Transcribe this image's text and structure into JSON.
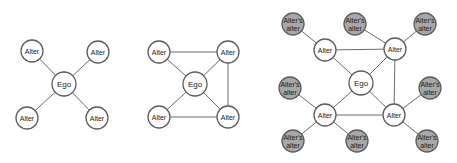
{
  "labels": {
    "ego": "Ego",
    "alter": "Alter",
    "alters_alter_line1": "Alter's",
    "alters_alter_line2": "alter"
  },
  "colors": {
    "node_fill": "#ffffff",
    "secondary_node_fill": "#a8a8a8",
    "edge": "#6b6b6b"
  },
  "panels": [
    {
      "name": "ego-only-network",
      "nodes": [
        {
          "id": "ego",
          "label": "Ego",
          "x": 64,
          "y": 84,
          "r": 12
        },
        {
          "id": "a1",
          "label": "Alter",
          "x": 32,
          "y": 51,
          "r": 11
        },
        {
          "id": "a2",
          "label": "Alter",
          "x": 98,
          "y": 52,
          "r": 11
        },
        {
          "id": "a3",
          "label": "Alter",
          "x": 27,
          "y": 118,
          "r": 11
        },
        {
          "id": "a4",
          "label": "Alter",
          "x": 97,
          "y": 118,
          "r": 11
        }
      ],
      "edges": [
        [
          "ego",
          "a1"
        ],
        [
          "ego",
          "a2"
        ],
        [
          "ego",
          "a3"
        ],
        [
          "ego",
          "a4"
        ]
      ]
    },
    {
      "name": "ego-with-alter-ties",
      "nodes": [
        {
          "id": "ego",
          "label": "Ego",
          "x": 195,
          "y": 84,
          "r": 12
        },
        {
          "id": "a1",
          "label": "Alter",
          "x": 159,
          "y": 52,
          "r": 11
        },
        {
          "id": "a2",
          "label": "Alter",
          "x": 228,
          "y": 52,
          "r": 11
        },
        {
          "id": "a3",
          "label": "Alter",
          "x": 159,
          "y": 117,
          "r": 11
        },
        {
          "id": "a4",
          "label": "Alter",
          "x": 228,
          "y": 117,
          "r": 11
        }
      ],
      "edges": [
        [
          "ego",
          "a1"
        ],
        [
          "ego",
          "a2"
        ],
        [
          "ego",
          "a3"
        ],
        [
          "ego",
          "a4"
        ],
        [
          "a1",
          "a2"
        ],
        [
          "a2",
          "a4"
        ],
        [
          "a3",
          "a4"
        ]
      ]
    },
    {
      "name": "ego-with-alters-alters",
      "nodes": [
        {
          "id": "ego",
          "label": "Ego",
          "x": 361,
          "y": 83,
          "r": 12
        },
        {
          "id": "a1",
          "label": "Alter",
          "x": 325,
          "y": 50,
          "r": 11
        },
        {
          "id": "a2",
          "label": "Alter",
          "x": 395,
          "y": 49,
          "r": 11
        },
        {
          "id": "a3",
          "label": "Alter",
          "x": 325,
          "y": 115,
          "r": 11
        },
        {
          "id": "a4",
          "label": "Alter",
          "x": 394,
          "y": 115,
          "r": 11
        },
        {
          "id": "g1",
          "label": "Alter's alter",
          "x": 293,
          "y": 24,
          "r": 11,
          "grey": true
        },
        {
          "id": "g2",
          "label": "Alter's alter",
          "x": 355,
          "y": 24,
          "r": 11,
          "grey": true
        },
        {
          "id": "g3",
          "label": "Alter's alter",
          "x": 425,
          "y": 24,
          "r": 11,
          "grey": true
        },
        {
          "id": "g4",
          "label": "Alter's alter",
          "x": 290,
          "y": 88,
          "r": 11,
          "grey": true
        },
        {
          "id": "g5",
          "label": "Alter's alter",
          "x": 430,
          "y": 88,
          "r": 11,
          "grey": true
        },
        {
          "id": "g6",
          "label": "Alter's alter",
          "x": 293,
          "y": 141,
          "r": 11,
          "grey": true
        },
        {
          "id": "g7",
          "label": "Alter's alter",
          "x": 357,
          "y": 141,
          "r": 11,
          "grey": true
        },
        {
          "id": "g8",
          "label": "Alter's alter",
          "x": 427,
          "y": 141,
          "r": 11,
          "grey": true
        }
      ],
      "edges": [
        [
          "ego",
          "a1"
        ],
        [
          "ego",
          "a2"
        ],
        [
          "ego",
          "a3"
        ],
        [
          "ego",
          "a4"
        ],
        [
          "a1",
          "a2"
        ],
        [
          "a2",
          "a4"
        ],
        [
          "a3",
          "a4"
        ],
        [
          "a1",
          "g1"
        ],
        [
          "a2",
          "g2"
        ],
        [
          "a2",
          "g3"
        ],
        [
          "a3",
          "g4"
        ],
        [
          "a4",
          "g5"
        ],
        [
          "a3",
          "g6"
        ],
        [
          "a3",
          "g7"
        ],
        [
          "a4",
          "g8"
        ]
      ]
    }
  ]
}
